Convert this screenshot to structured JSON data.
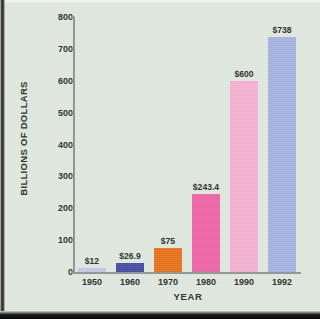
{
  "chart_data": {
    "type": "bar",
    "title": "",
    "xlabel": "YEAR",
    "ylabel": "BILLIONS OF DOLLARS",
    "categories": [
      "1950",
      "1960",
      "1970",
      "1980",
      "1990",
      "1992"
    ],
    "values": [
      12,
      26.9,
      75,
      243.4,
      600,
      738
    ],
    "data_labels": [
      "$12",
      "$26.9",
      "$75",
      "$243.4",
      "$600",
      "$738"
    ],
    "ylim": [
      0,
      800
    ],
    "yticks": [
      "0",
      "100",
      "200",
      "300",
      "400",
      "500",
      "600",
      "700",
      "800"
    ],
    "ytick_values": [
      0,
      100,
      200,
      300,
      400,
      500,
      600,
      700,
      800
    ],
    "grid": false,
    "legend": false,
    "bar_colors": [
      "#c6cbe8",
      "#4a50a8",
      "#e8761e",
      "#f068a8",
      "#f7b4d4",
      "#a9b6e2"
    ],
    "plot_background": "#e2eae0",
    "axis_color": "#8e9a94",
    "text_color": "#2d3230"
  },
  "figure": {
    "background": "#e3ebe0"
  }
}
